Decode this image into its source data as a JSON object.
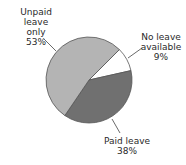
{
  "chart_data": {
    "type": "pie",
    "title": "",
    "categories": [
      "No leave available",
      "Paid leave",
      "Unpaid leave only"
    ],
    "values": [
      9,
      38,
      53
    ],
    "unit": "%",
    "colors": [
      "#ffffff",
      "#707070",
      "#b4b4b4"
    ],
    "legend": "none (direct labels with leader lines)",
    "labels": [
      {
        "name": "No leave available",
        "line1": "No leave",
        "line2": "available",
        "value": "9%"
      },
      {
        "name": "Paid leave",
        "line1": "Paid leave",
        "line2": "38%"
      },
      {
        "name": "Unpaid leave only",
        "line1": "Unpaid leave",
        "line2": "only",
        "value": "53%"
      }
    ]
  },
  "labels": {
    "unpaid": {
      "l1": "Unpaid leave",
      "l2": "only",
      "l3": "53%"
    },
    "noleave": {
      "l1": "No leave",
      "l2": "available",
      "l3": "9%"
    },
    "paid": {
      "l1": "Paid leave",
      "l2": "38%"
    }
  }
}
